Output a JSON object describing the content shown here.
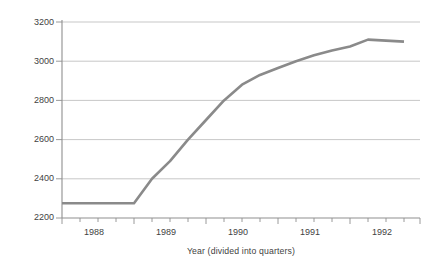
{
  "chart_data": {
    "type": "line",
    "title": "",
    "xlabel": "Year (divided into quarters)",
    "ylabel": "Pesos/dollar",
    "ylim": [
      2200,
      3200
    ],
    "yticks": [
      2200,
      2400,
      2600,
      2800,
      3000,
      3200
    ],
    "xticks_labeled": [
      "1988",
      "1989",
      "1990",
      "1991",
      "1992"
    ],
    "x_tick_count": 22,
    "x_minor_description": "quarterly tick marks between labeled years",
    "grid": "horizontal gridlines at each y tick",
    "legend": "none",
    "series": [
      {
        "name": "Pesos/dollar exchange rate",
        "color": "#8a8a8a",
        "x": [
          "1987 Q4",
          "1988 Q1",
          "1988 Q2",
          "1988 Q3",
          "1988 Q4",
          "1989 Q1",
          "1989 Q2",
          "1989 Q3",
          "1989 Q4",
          "1990 Q1",
          "1990 Q2",
          "1990 Q3",
          "1990 Q4",
          "1991 Q1",
          "1991 Q2",
          "1991 Q3",
          "1991 Q4",
          "1992 Q1",
          "1992 Q2",
          "1992 Q3"
        ],
        "values": [
          2275,
          2275,
          2275,
          2275,
          2275,
          2400,
          2490,
          2600,
          2700,
          2800,
          2880,
          2930,
          2965,
          3000,
          3030,
          3055,
          3075,
          3110,
          3105,
          3100
        ]
      }
    ],
    "annotations": [
      "Flat at 2275 pesos/dollar through 1988",
      "Steep rise beginning early 1989 through 1990",
      "Gradual flattening across 1991",
      "Peak near 3110 at 1992, slight decline to about 3100"
    ]
  },
  "axes": {
    "y_tick_labels": [
      "3200",
      "3000",
      "2800",
      "2600",
      "2400",
      "2200"
    ],
    "x_tick_labels": [
      "1988",
      "1989",
      "1990",
      "1991",
      "1992"
    ]
  },
  "colors": {
    "line": "#8a8a8a",
    "grid": "#b9b9b9",
    "axis": "#8f8f8f",
    "text": "#3f3f3f"
  }
}
